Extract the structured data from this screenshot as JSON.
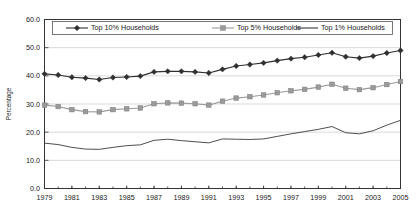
{
  "chart_data": {
    "type": "line",
    "title": "",
    "xlabel": "",
    "ylabel": "Percentage",
    "ylim": [
      0,
      60
    ],
    "xlim": [
      1979,
      2005
    ],
    "yticks": [
      "0.0",
      "10.0",
      "20.0",
      "30.0",
      "40.0",
      "50.0",
      "60.0"
    ],
    "ytick_values": [
      0,
      10,
      20,
      30,
      40,
      50,
      60
    ],
    "xticks": [
      "1979",
      "1981",
      "1983",
      "1985",
      "1987",
      "1989",
      "1991",
      "1993",
      "1995",
      "1997",
      "1999",
      "2001",
      "2003",
      "2005"
    ],
    "xtick_values": [
      1979,
      1981,
      1983,
      1985,
      1987,
      1989,
      1991,
      1993,
      1995,
      1997,
      1999,
      2001,
      2003,
      2005
    ],
    "grid": true,
    "legend_position": "top-inside",
    "x": [
      1979,
      1980,
      1981,
      1982,
      1983,
      1984,
      1985,
      1986,
      1987,
      1988,
      1989,
      1990,
      1991,
      1992,
      1993,
      1994,
      1995,
      1996,
      1997,
      1998,
      1999,
      2000,
      2001,
      2002,
      2003,
      2004,
      2005
    ],
    "series": [
      {
        "name": "Top 10% Households",
        "color": "#303030",
        "marker": "diamond",
        "values": [
          40.7,
          40.3,
          39.5,
          39.2,
          38.7,
          39.4,
          39.6,
          39.9,
          41.4,
          41.6,
          41.6,
          41.4,
          41.0,
          42.3,
          43.5,
          44.0,
          44.6,
          45.4,
          46.1,
          46.6,
          47.4,
          48.2,
          46.8,
          46.3,
          47.0,
          48.1,
          49.0
        ],
        "endpoint_1979": 40.7,
        "endpoint_2005": 49.0
      },
      {
        "name": "Top 5% Households",
        "color": "#9a9a9a",
        "marker": "square",
        "values": [
          29.6,
          29.1,
          28.0,
          27.3,
          27.2,
          28.0,
          28.3,
          28.6,
          30.1,
          30.4,
          30.3,
          30.1,
          29.6,
          31.0,
          32.1,
          32.6,
          33.2,
          34.0,
          34.7,
          35.2,
          36.0,
          37.0,
          35.6,
          35.1,
          35.8,
          36.9,
          38.0
        ],
        "endpoint_1979": 29.6,
        "endpoint_2005": 38.0
      },
      {
        "name": "Top 1% Households",
        "color": "#3a3a3a",
        "marker": "none",
        "values": [
          16.1,
          15.6,
          14.6,
          14.0,
          13.9,
          14.6,
          15.2,
          15.5,
          17.1,
          17.5,
          17.0,
          16.6,
          16.2,
          17.6,
          17.5,
          17.4,
          17.6,
          18.5,
          19.4,
          20.2,
          21.0,
          22.0,
          19.8,
          19.4,
          20.5,
          22.5,
          24.2
        ],
        "endpoint_1979": 16.1,
        "endpoint_2005": 24.2
      }
    ]
  }
}
